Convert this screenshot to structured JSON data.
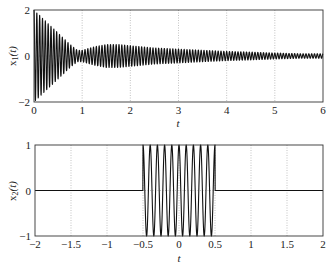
{
  "chart_data": [
    {
      "type": "line",
      "title": "",
      "xlabel": "t",
      "ylabel": "x1(t)",
      "xlim": [
        0,
        6
      ],
      "ylim": [
        -2,
        2
      ],
      "xticks": [
        "0",
        "1",
        "2",
        "3",
        "4",
        "5",
        "6"
      ],
      "yticks": [
        "2",
        "0",
        "-2"
      ],
      "grid": true,
      "description": "Oscillating signal (~17 cycles per unit t) with beating envelope: starts at amplitude 2 at t=0, decays to near 0 at t~0.9, second lobe peaks ~0.5 near t~1.6, then slowly decays toward ~0.1 by t=6",
      "envelope": {
        "t": [
          0,
          0.25,
          0.5,
          0.75,
          0.9,
          1.0,
          1.25,
          1.5,
          1.75,
          2.0,
          2.5,
          3.0,
          3.5,
          4.0,
          4.5,
          5.0,
          5.5,
          6.0
        ],
        "amplitude": [
          2.0,
          1.5,
          1.0,
          0.5,
          0.25,
          0.25,
          0.4,
          0.5,
          0.5,
          0.45,
          0.35,
          0.3,
          0.25,
          0.2,
          0.17,
          0.13,
          0.1,
          0.1
        ]
      },
      "frequency_cycles_per_unit": 17
    },
    {
      "type": "line",
      "title": "",
      "xlabel": "t",
      "ylabel": "x2(t)",
      "xlim": [
        -2,
        2
      ],
      "ylim": [
        -1,
        1
      ],
      "xticks": [
        "-2",
        "-1.5",
        "-1",
        "-0.5",
        "0",
        "0.5",
        "1",
        "1.5",
        "2"
      ],
      "yticks": [
        "1",
        "0",
        "-1"
      ],
      "grid": true,
      "description": "Sinusoidal burst of amplitude 1 (~10 cycles) on -0.5 < t < 0.5, zero elsewhere",
      "burst": {
        "t_start": -0.5,
        "t_end": 0.5,
        "amplitude": 1,
        "frequency_cycles_per_unit": 10
      }
    }
  ],
  "labels": {
    "top": {
      "ylabel_main": "x",
      "ylabel_sub": "1",
      "ylabel_arg": "(t)",
      "xlabel": "t"
    },
    "bottom": {
      "ylabel_main": "x",
      "ylabel_sub": "2",
      "ylabel_arg": "(t)",
      "xlabel": "t"
    }
  }
}
